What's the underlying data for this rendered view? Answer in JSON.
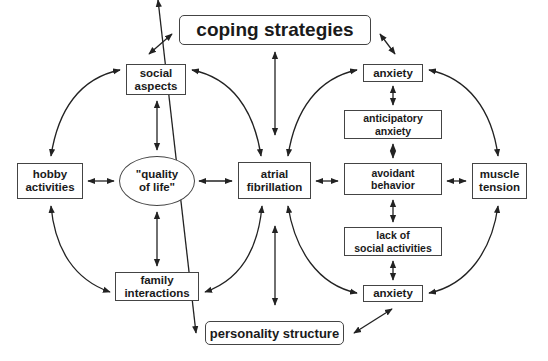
{
  "diagram": {
    "type": "concept-map",
    "nodes": {
      "coping_strategies": {
        "line1": "coping strategies"
      },
      "social_aspects": {
        "line1": "social",
        "line2": "aspects"
      },
      "anxiety_top": {
        "line1": "anxiety"
      },
      "anticipatory_anxiety": {
        "line1": "anticipatory",
        "line2": "anxiety"
      },
      "hobby_activities": {
        "line1": "hobby",
        "line2": "activities"
      },
      "quality_of_life": {
        "line1": "\"quality",
        "line2": "of life\""
      },
      "atrial_fibrillation": {
        "line1": "atrial",
        "line2": "fibrillation"
      },
      "avoidant_behavior": {
        "line1": "avoidant",
        "line2": "behavior"
      },
      "muscle_tension": {
        "line1": "muscle",
        "line2": "tension"
      },
      "lack_of_social_activities": {
        "line1": "lack of",
        "line2": "social activities"
      },
      "family_interactions": {
        "line1": "family",
        "line2": "interactions"
      },
      "anxiety_bottom": {
        "line1": "anxiety"
      },
      "personality_structure": {
        "line1": "personality structure"
      }
    },
    "edges": [
      [
        "coping strategies",
        "social aspects",
        "bidirectional"
      ],
      [
        "coping strategies",
        "atrial fibrillation",
        "bidirectional"
      ],
      [
        "coping strategies",
        "anxiety (top)",
        "bidirectional"
      ],
      [
        "social aspects",
        "hobby activities",
        "bidirectional"
      ],
      [
        "social aspects",
        "\"quality of life\"",
        "bidirectional"
      ],
      [
        "social aspects",
        "atrial fibrillation",
        "bidirectional"
      ],
      [
        "hobby activities",
        "\"quality of life\"",
        "bidirectional"
      ],
      [
        "\"quality of life\"",
        "atrial fibrillation",
        "bidirectional"
      ],
      [
        "\"quality of life\"",
        "family interactions",
        "bidirectional"
      ],
      [
        "hobby activities",
        "family interactions",
        "bidirectional"
      ],
      [
        "atrial fibrillation",
        "family interactions",
        "bidirectional"
      ],
      [
        "atrial fibrillation",
        "anxiety (top)",
        "bidirectional"
      ],
      [
        "atrial fibrillation",
        "avoidant behavior",
        "bidirectional"
      ],
      [
        "atrial fibrillation",
        "anxiety (bottom)",
        "bidirectional"
      ],
      [
        "atrial fibrillation",
        "personality structure",
        "bidirectional"
      ],
      [
        "anxiety (top)",
        "anticipatory anxiety",
        "bidirectional"
      ],
      [
        "anxiety (top)",
        "muscle tension",
        "bidirectional"
      ],
      [
        "anticipatory anxiety",
        "avoidant behavior",
        "bidirectional"
      ],
      [
        "avoidant behavior",
        "muscle tension",
        "bidirectional"
      ],
      [
        "avoidant behavior",
        "lack of social activities",
        "bidirectional"
      ],
      [
        "lack of social activities",
        "anxiety (bottom)",
        "bidirectional"
      ],
      [
        "muscle tension",
        "anxiety (bottom)",
        "bidirectional"
      ],
      [
        "family interactions",
        "personality structure",
        "bidirectional"
      ],
      [
        "anxiety (bottom)",
        "personality structure",
        "bidirectional"
      ]
    ]
  }
}
